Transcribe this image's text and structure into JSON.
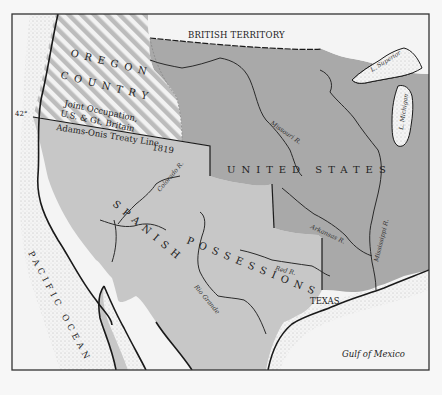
{
  "map": {
    "colors": {
      "paper": "#f7f7f7",
      "ocean": "#f4f4f4",
      "united_states": "#a9a9a9",
      "spanish_possessions": "#c7c7c7",
      "oregon_stripe_light": "#f2f2f2",
      "oregon_stripe_dark": "#b9b9b9",
      "frame": "#333333",
      "stipple": "#9a9a9a"
    },
    "regions": {
      "british_territory": "BRITISH TERRITORY",
      "oregon_line1": "OREGON",
      "oregon_line2": "COUNTRY",
      "joint_occupation_line1": "Joint Occupation,",
      "joint_occupation_line2": "U.S. & Gt. Britain",
      "united_states": "UNITED STATES",
      "spanish": "SPANISH",
      "possessions": "POSSESSIONS",
      "texas": "TEXAS"
    },
    "lines": {
      "treaty_line": "Adams-Onis Treaty Line",
      "treaty_year": "1819",
      "latitude": "42°"
    },
    "water": {
      "pacific": "PACIFIC OCEAN",
      "gulf": "Gulf of Mexico",
      "lake_superior": "L. Superior",
      "lake_michigan": "L. Michigan"
    },
    "rivers": {
      "missouri": "Missouri R.",
      "colorado": "Colorado R.",
      "arkansas": "Arkansas R.",
      "mississippi": "Mississippi R.",
      "red": "Red R.",
      "rio_grande": "Rio Grande"
    }
  }
}
